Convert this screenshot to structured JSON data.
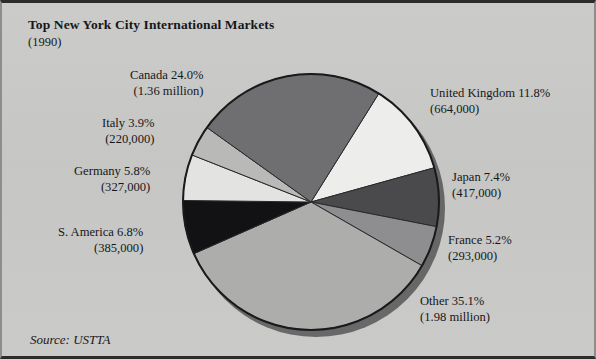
{
  "figure": {
    "title": "Top New York City International Markets",
    "subtitle": "(1990)",
    "source": "Source: USTTA"
  },
  "labels": {
    "canada": {
      "line1": "Canada 24.0%",
      "line2": "(1.36 million)"
    },
    "italy": {
      "line1": "Italy 3.9%",
      "line2": "(220,000)"
    },
    "germany": {
      "line1": "Germany 5.8%",
      "line2": "(327,000)"
    },
    "samerica": {
      "line1": "S. America 6.8%",
      "line2": "(385,000)"
    },
    "uk": {
      "line1": "United Kingdom 11.8%",
      "line2": "(664,000)"
    },
    "japan": {
      "line1": "Japan 7.4%",
      "line2": "(417,000)"
    },
    "france": {
      "line1": "France 5.2%",
      "line2": "(293,000)"
    },
    "other": {
      "line1": "Other 35.1%",
      "line2": "(1.98 million)"
    }
  },
  "chart_data": {
    "type": "pie",
    "title": "Top New York City International Markets",
    "subtitle": "(1990)",
    "source": "Source: USTTA",
    "unit": "visitors",
    "start_angle_deg": -58,
    "direction": "clockwise",
    "center": [
      309,
      199
    ],
    "radius": 128,
    "categories": [
      "United Kingdom",
      "Japan",
      "France",
      "Other",
      "S. America",
      "Germany",
      "Italy",
      "Canada"
    ],
    "values": [
      11.8,
      7.4,
      5.2,
      35.1,
      6.8,
      5.8,
      3.9,
      24.0
    ],
    "counts": [
      664000,
      417000,
      293000,
      1980000,
      385000,
      327000,
      220000,
      1360000
    ],
    "count_labels": [
      "664,000",
      "417,000",
      "293,000",
      "1.98 million",
      "385,000",
      "327,000",
      "220,000",
      "1.36 million"
    ],
    "colors": [
      "#ededeb",
      "#4a4a4c",
      "#8e8e90",
      "#adadab",
      "#121214",
      "#e3e3e1",
      "#b9b9b7",
      "#6f6f71"
    ],
    "slice_edge_color": "#2a2a2c",
    "outline_color": "#1a1a1c",
    "legend": "none",
    "grid": false
  }
}
